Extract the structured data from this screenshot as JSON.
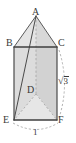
{
  "figure": {
    "kind": "geometry-diagram",
    "background_color": "#ffffff",
    "stroke_color": "#4a4a4a",
    "hidden_stroke_color": "#9a9a9a",
    "face_fill_light": "#e2e2e2",
    "face_fill_dark": "#cfcfcf",
    "face_fill_top": "#eaeaea",
    "label_color": "#3a3a3a",
    "vertices": [
      {
        "id": "A",
        "label": "A",
        "x": 36,
        "y": 16,
        "hidden": false
      },
      {
        "id": "B",
        "label": "B",
        "x": 14,
        "y": 47,
        "hidden": false
      },
      {
        "id": "C",
        "label": "C",
        "x": 57,
        "y": 47,
        "hidden": false
      },
      {
        "id": "D",
        "label": "D",
        "x": 36,
        "y": 94,
        "hidden": true
      },
      {
        "id": "E",
        "label": "E",
        "x": 14,
        "y": 120,
        "hidden": false
      },
      {
        "id": "F",
        "label": "F",
        "x": 57,
        "y": 120,
        "hidden": false
      }
    ],
    "measurements": [
      {
        "id": "slant",
        "label": "√3",
        "radicand": "3",
        "position": "right"
      },
      {
        "id": "base",
        "label": "1",
        "position": "bottom"
      }
    ]
  }
}
